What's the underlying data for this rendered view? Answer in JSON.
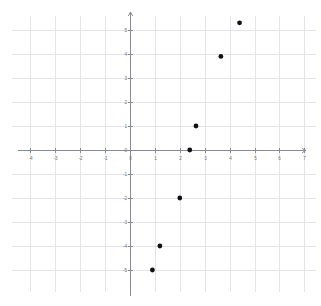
{
  "chart_data": {
    "type": "scatter",
    "title": "",
    "subtitle": "",
    "xlabel": "",
    "ylabel": "",
    "xlim": [
      -4.6,
      7.5
    ],
    "ylim": [
      -5.7,
      5.6
    ],
    "grid": true,
    "legend": null,
    "x_ticks": [
      -4,
      -3,
      -2,
      -1,
      0,
      1,
      2,
      3,
      4,
      5,
      6,
      7
    ],
    "y_ticks": [
      -5,
      -4,
      -3,
      -2,
      -1,
      0,
      1,
      2,
      3,
      4,
      5
    ],
    "x_tick_labels": [
      "-4",
      "-3",
      "-2",
      "-1",
      "0",
      "1",
      "2",
      "3",
      "4",
      "5",
      "6",
      "7"
    ],
    "y_tick_labels": [
      "-5",
      "-4",
      "-3",
      "-2",
      "-1",
      "0",
      "1",
      "2",
      "3",
      "4",
      "5"
    ],
    "point_color": "#111111",
    "grid_color": "#e3e3e8",
    "axis_color": "#8a8a92",
    "series": [
      {
        "name": "points",
        "points": [
          {
            "x": 0.9,
            "y": -5.0,
            "label": "(0.9, -5)"
          },
          {
            "x": 1.2,
            "y": -4.0,
            "label": "(1.2, -4)"
          },
          {
            "x": 2.0,
            "y": -2.0,
            "label": "(2, -2)"
          },
          {
            "x": 2.4,
            "y": 0.0,
            "label": "(2.4, 0)"
          },
          {
            "x": 2.65,
            "y": 1.0,
            "label": "(2.65, 1)"
          },
          {
            "x": 3.65,
            "y": 3.9,
            "label": "(3.65, 3.9)"
          },
          {
            "x": 4.4,
            "y": 5.3,
            "label": "(4.4, 5.3)"
          }
        ]
      }
    ]
  },
  "plot": {
    "origin_px": {
      "x": 130,
      "y": 150
    },
    "unit_px": {
      "x": 24.9,
      "y": 24.0
    },
    "point_radius_px": 2.4,
    "grid_x_range": [
      -4,
      7
    ],
    "grid_y_range": [
      -5,
      5
    ]
  }
}
